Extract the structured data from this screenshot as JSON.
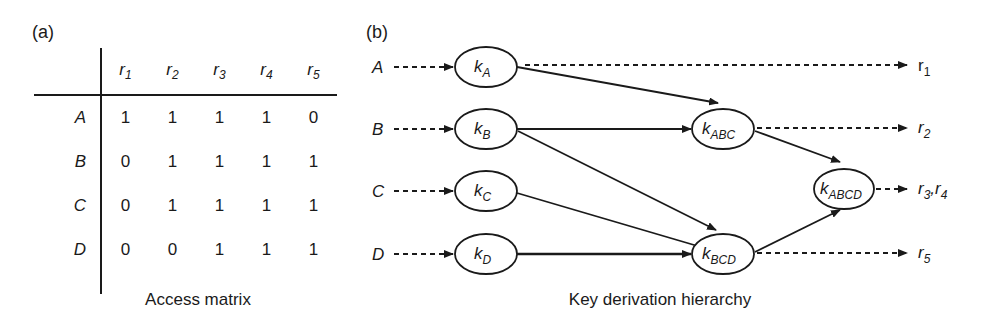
{
  "panel_a": {
    "label": "(a)",
    "caption": "Access matrix",
    "columns": [
      "r1",
      "r2",
      "r3",
      "r4",
      "r5"
    ],
    "column_subscripts": [
      "1",
      "2",
      "3",
      "4",
      "5"
    ],
    "rows": [
      {
        "label": "A",
        "values": [
          "1",
          "1",
          "1",
          "1",
          "0"
        ]
      },
      {
        "label": "B",
        "values": [
          "0",
          "1",
          "1",
          "1",
          "1"
        ]
      },
      {
        "label": "C",
        "values": [
          "0",
          "1",
          "1",
          "1",
          "1"
        ]
      },
      {
        "label": "D",
        "values": [
          "0",
          "0",
          "1",
          "1",
          "1"
        ]
      }
    ]
  },
  "panel_b": {
    "label": "(b)",
    "caption": "Key derivation hierarchy",
    "inputs": [
      "A",
      "B",
      "C",
      "D"
    ],
    "nodes": [
      {
        "id": "kA",
        "base": "k",
        "sub": "A"
      },
      {
        "id": "kB",
        "base": "k",
        "sub": "B"
      },
      {
        "id": "kC",
        "base": "k",
        "sub": "C"
      },
      {
        "id": "kD",
        "base": "k",
        "sub": "D"
      },
      {
        "id": "kABC",
        "base": "k",
        "sub": "ABC"
      },
      {
        "id": "kBCD",
        "base": "k",
        "sub": "BCD"
      },
      {
        "id": "kABCD",
        "base": "k",
        "sub": "ABCD"
      }
    ],
    "outputs": [
      {
        "from": "kA",
        "base": "r",
        "sub": "1"
      },
      {
        "from": "kABC",
        "base": "r",
        "sub": "2"
      },
      {
        "from": "kABCD",
        "base": "r",
        "sub": "3",
        "base2": "r",
        "sub2": "4"
      },
      {
        "from": "kBCD",
        "base": "r",
        "sub": "5"
      }
    ],
    "edges": [
      {
        "from": "kA",
        "to": "kABC"
      },
      {
        "from": "kB",
        "to": "kABC"
      },
      {
        "from": "kB",
        "to": "kBCD"
      },
      {
        "from": "kC",
        "to": "kBCD"
      },
      {
        "from": "kD",
        "to": "kBCD"
      },
      {
        "from": "kABC",
        "to": "kABCD"
      },
      {
        "from": "kBCD",
        "to": "kABCD"
      }
    ]
  }
}
